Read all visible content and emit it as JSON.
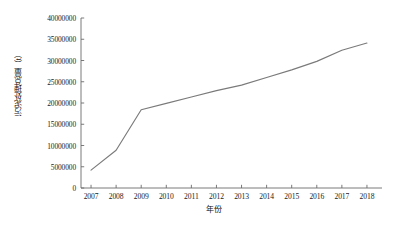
{
  "chart_data": {
    "type": "line",
    "title": "",
    "xlabel": "年份",
    "ylabel": "污泥处理总量（t）",
    "categories": [
      "2007",
      "2008",
      "2009",
      "2010",
      "2011",
      "2012",
      "2013",
      "2014",
      "2015",
      "2016",
      "2017",
      "2018"
    ],
    "x": [
      2007,
      2008,
      2009,
      2010,
      2011,
      2012,
      2013,
      2014,
      2015,
      2016,
      2017,
      2018
    ],
    "values": [
      4200000,
      8900000,
      18400000,
      19900000,
      21400000,
      22900000,
      24200000,
      26000000,
      27800000,
      29800000,
      32400000,
      34100000
    ],
    "series": [
      {
        "name": "污泥处理总量",
        "values": [
          4200000,
          8900000,
          18400000,
          19900000,
          21400000,
          22900000,
          24200000,
          26000000,
          27800000,
          29800000,
          32400000,
          34100000
        ],
        "color": "#7a7a7a"
      }
    ],
    "ylim": [
      0,
      40000000
    ],
    "yticks": [
      0,
      5000000,
      10000000,
      15000000,
      20000000,
      25000000,
      30000000,
      35000000,
      40000000
    ],
    "ytick_labels": [
      "0",
      "5000000",
      "10000000",
      "15000000",
      "20000000",
      "25000000",
      "30000000",
      "35000000",
      "40000000"
    ],
    "xlim": [
      2006.6,
      2018.6
    ],
    "grid": false,
    "legend": "none",
    "axis_color": "#6b6b6b",
    "line_color": "#7a7a7a",
    "background": "#ffffff"
  }
}
